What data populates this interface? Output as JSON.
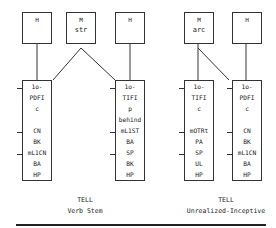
{
  "top_boxes": [
    {
      "line1": "H",
      "line2": ""
    },
    {
      "line1": "M",
      "line2": "str"
    },
    {
      "line1": "H",
      "line2": ""
    },
    {
      "line1": "M",
      "line2": "arc"
    },
    {
      "line1": "H",
      "line2": ""
    }
  ],
  "columns": [
    {
      "rows": [
        "1o-",
        "PDFI",
        "c",
        "",
        "CN",
        "BK",
        "mL1CN",
        "BA",
        "HP"
      ],
      "ticks": [
        0,
        4,
        6
      ]
    },
    {
      "rows": [
        "1o-",
        "TIFI",
        "p",
        "behind",
        "mL1ST",
        "BA",
        "SP",
        "BK",
        "HP"
      ],
      "ticks": [
        0,
        4,
        6
      ]
    },
    {
      "rows": [
        "1o-",
        "TIFI",
        "c",
        "",
        "mOTRt",
        "PA",
        "SP",
        "UL",
        "HP"
      ],
      "ticks": [
        0,
        4,
        6
      ]
    },
    {
      "rows": [
        "1o-",
        "PDFI",
        "c",
        "",
        "CN",
        "BK",
        "mL1CN",
        "BA",
        "HP"
      ],
      "ticks": [
        0,
        4,
        6
      ]
    }
  ],
  "captions": [
    {
      "title": "TELL",
      "subtitle": "Verb Stem"
    },
    {
      "title": "TELL",
      "subtitle": "Unrealized-Inceptive"
    }
  ]
}
